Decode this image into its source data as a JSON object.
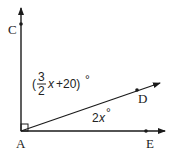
{
  "diagram": {
    "type": "angle-diagram",
    "points": {
      "A": {
        "label": "A",
        "x": 21,
        "y": 131
      },
      "C": {
        "label": "C",
        "x": 21,
        "y": 24
      },
      "D": {
        "label": "D",
        "x": 137,
        "y": 90
      },
      "E": {
        "label": "E",
        "x": 146,
        "y": 131
      }
    },
    "rays": [
      {
        "name": "AC",
        "from": "A",
        "to": "C"
      },
      {
        "name": "AD",
        "from": "A",
        "to": "D"
      },
      {
        "name": "AE",
        "from": "A",
        "to": "E"
      }
    ],
    "right_angle_at": "A",
    "angles": {
      "CAD": {
        "open_paren": "(",
        "numerator": "3",
        "denominator": "2",
        "variable": "x",
        "rest": "+20)",
        "degree": "°"
      },
      "DAE": {
        "coef": "2",
        "variable": "x",
        "degree": "°"
      }
    },
    "colors": {
      "stroke": "#1a1a1a",
      "text": "#222222",
      "background": "#ffffff"
    }
  }
}
